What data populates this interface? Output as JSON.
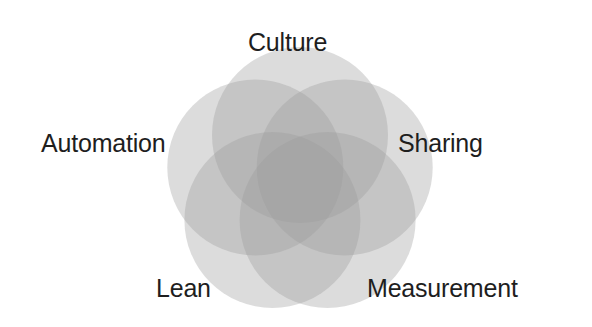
{
  "diagram": {
    "type": "five-set venn / flower",
    "fill_color": "#9a9a9a",
    "fill_opacity": 0.35,
    "center": [
      300,
      182
    ],
    "radius": 88,
    "circle_offset": 47,
    "labels": [
      {
        "text": "Culture",
        "x": 248,
        "y": 30
      },
      {
        "text": "Sharing",
        "x": 398,
        "y": 131
      },
      {
        "text": "Measurement",
        "x": 367,
        "y": 276
      },
      {
        "text": "Lean",
        "x": 156,
        "y": 276
      },
      {
        "text": "Automation",
        "x": 41,
        "y": 131
      }
    ]
  }
}
